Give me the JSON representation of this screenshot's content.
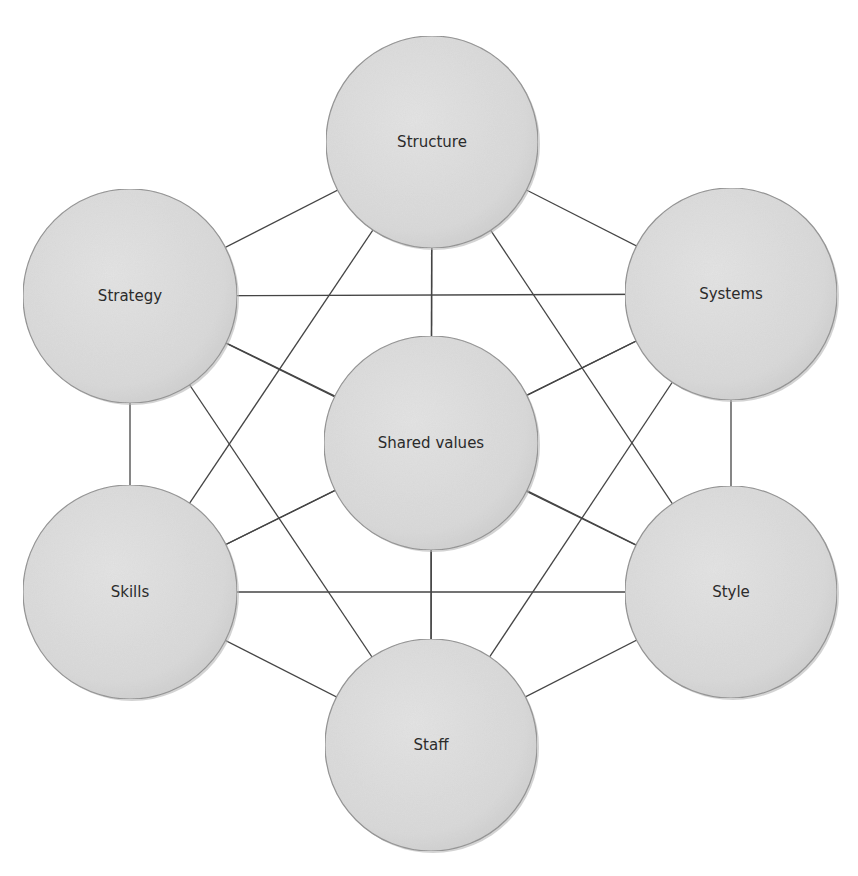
{
  "diagram": {
    "title": "",
    "type": "complete-graph",
    "style": {
      "line_color": "#454545",
      "node_fill": "#d8d8d8",
      "node_fill_highlight": "#e6e6e6",
      "node_stroke": "#8e8e8e",
      "text_color": "#2b2b2b",
      "background": "#ffffff"
    },
    "nodes": [
      {
        "id": "structure",
        "label": "Structure",
        "cx": 432,
        "cy": 142,
        "r": 106
      },
      {
        "id": "strategy",
        "label": "Strategy",
        "cx": 130,
        "cy": 296,
        "r": 107
      },
      {
        "id": "systems",
        "label": "Systems",
        "cx": 731,
        "cy": 294,
        "r": 106
      },
      {
        "id": "shared_values",
        "label": "Shared values",
        "cx": 431,
        "cy": 443,
        "r": 107
      },
      {
        "id": "skills",
        "label": "Skills",
        "cx": 130,
        "cy": 592,
        "r": 107
      },
      {
        "id": "style",
        "label": "Style",
        "cx": 731,
        "cy": 592,
        "r": 106
      },
      {
        "id": "staff",
        "label": "Staff",
        "cx": 431,
        "cy": 745,
        "r": 106
      }
    ],
    "edges": [
      [
        "structure",
        "strategy"
      ],
      [
        "structure",
        "systems"
      ],
      [
        "structure",
        "shared_values"
      ],
      [
        "structure",
        "skills"
      ],
      [
        "structure",
        "style"
      ],
      [
        "structure",
        "staff"
      ],
      [
        "strategy",
        "systems"
      ],
      [
        "strategy",
        "shared_values"
      ],
      [
        "strategy",
        "skills"
      ],
      [
        "strategy",
        "style"
      ],
      [
        "strategy",
        "staff"
      ],
      [
        "systems",
        "shared_values"
      ],
      [
        "systems",
        "skills"
      ],
      [
        "systems",
        "style"
      ],
      [
        "systems",
        "staff"
      ],
      [
        "shared_values",
        "skills"
      ],
      [
        "shared_values",
        "style"
      ],
      [
        "shared_values",
        "staff"
      ],
      [
        "skills",
        "style"
      ],
      [
        "skills",
        "staff"
      ],
      [
        "style",
        "staff"
      ]
    ]
  }
}
